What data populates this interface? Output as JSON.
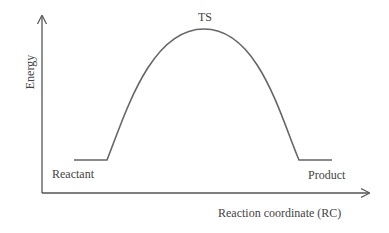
{
  "diagram": {
    "axes": {
      "y_label": "Energy",
      "x_label": "Reaction coordinate (RC)"
    },
    "points": {
      "transition_state": "TS",
      "reactant": "Reactant",
      "product": "Product"
    },
    "colors": {
      "axis": "#555555",
      "curve": "#666666",
      "text": "#444444"
    }
  }
}
